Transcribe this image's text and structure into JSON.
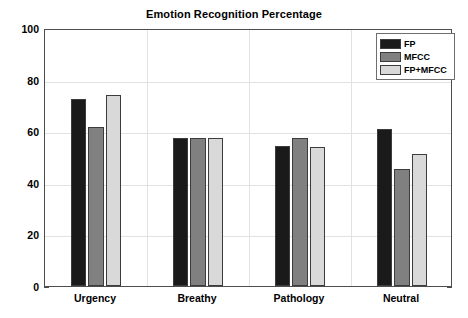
{
  "chart_data": {
    "type": "bar",
    "title": "Emotion Recognition Percentage",
    "xlabel": "",
    "ylabel": "",
    "categories": [
      "Urgency",
      "Breathy",
      "Pathology",
      "Neutral"
    ],
    "series": [
      {
        "name": "FP",
        "color": "#1a1a1a",
        "values": [
          72.5,
          57.2,
          54.3,
          60.8
        ]
      },
      {
        "name": "MFCC",
        "color": "#808080",
        "values": [
          61.6,
          57.3,
          57.4,
          45.3
        ]
      },
      {
        "name": "FP+MFCC",
        "color": "#d9d9d9",
        "values": [
          74.0,
          57.4,
          53.9,
          51.2
        ]
      }
    ],
    "ylim": [
      0,
      100
    ],
    "yticks": [
      0,
      20,
      40,
      60,
      80,
      100
    ],
    "ytick_labels": [
      "0",
      "20",
      "40",
      "60",
      "80",
      "100"
    ],
    "grid": true,
    "grid_axis": "both",
    "legend_position": "upper right",
    "bar_edge_color": "#3c3c3c",
    "axis_color": "#4d4d4d",
    "grid_color": "#e2e2e2",
    "background": "#ffffff"
  }
}
